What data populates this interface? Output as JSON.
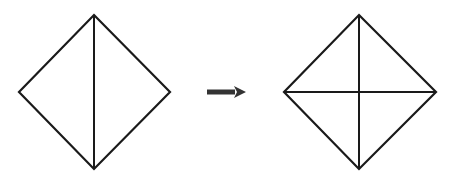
{
  "diagram": {
    "stroke_color": "#1a1a1a",
    "arrow_color": "#333333",
    "background": "#ffffff",
    "before": {
      "name": "diamond-with-vertical-line",
      "vertices": {
        "top": [
          94,
          15
        ],
        "right": [
          170,
          92
        ],
        "bottom": [
          94,
          169
        ],
        "left": [
          19,
          92
        ]
      },
      "lines": [
        {
          "from": [
            94,
            15
          ],
          "to": [
            94,
            169
          ]
        }
      ]
    },
    "arrow": {
      "from": [
        207,
        92
      ],
      "to": [
        246,
        92
      ],
      "direction": "right"
    },
    "after": {
      "name": "diamond-with-cross-lines",
      "vertices": {
        "top": [
          359,
          15
        ],
        "right": [
          436,
          92
        ],
        "bottom": [
          359,
          169
        ],
        "left": [
          284,
          92
        ]
      },
      "lines": [
        {
          "from": [
            359,
            15
          ],
          "to": [
            359,
            169
          ]
        },
        {
          "from": [
            284,
            92
          ],
          "to": [
            436,
            92
          ]
        }
      ]
    }
  }
}
